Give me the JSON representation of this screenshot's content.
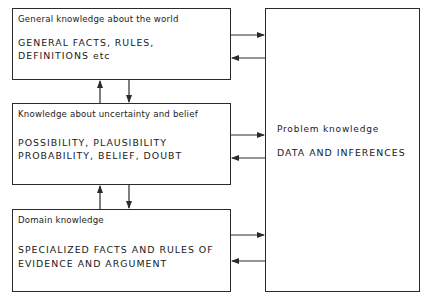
{
  "boxes": {
    "general": {
      "title": "General knowledge about the world",
      "line1": "GENERAL FACTS, RULES,",
      "line2": "DEFINITIONS etc"
    },
    "uncertainty": {
      "title": "Knowledge about uncertainty and belief",
      "line1": "POSSIBILITY, PLAUSIBILITY",
      "line2": "PROBABILITY, BELIEF, DOUBT"
    },
    "domain": {
      "title": "Domain knowledge",
      "line1": "SPECIALIZED FACTS AND RULES OF",
      "line2": "EVIDENCE AND ARGUMENT"
    },
    "problem": {
      "title": "Problem knowledge",
      "line1": "DATA AND INFERENCES"
    }
  },
  "connections": [
    {
      "from": "general",
      "to": "problem",
      "direction": "right"
    },
    {
      "from": "problem",
      "to": "general",
      "direction": "left"
    },
    {
      "from": "uncertainty",
      "to": "general",
      "direction": "up"
    },
    {
      "from": "general",
      "to": "uncertainty",
      "direction": "down"
    },
    {
      "from": "uncertainty",
      "to": "problem",
      "direction": "right"
    },
    {
      "from": "problem",
      "to": "uncertainty",
      "direction": "left"
    },
    {
      "from": "domain",
      "to": "uncertainty",
      "direction": "up"
    },
    {
      "from": "uncertainty",
      "to": "domain",
      "direction": "down"
    },
    {
      "from": "domain",
      "to": "problem",
      "direction": "right"
    },
    {
      "from": "problem",
      "to": "domain",
      "direction": "left"
    }
  ]
}
